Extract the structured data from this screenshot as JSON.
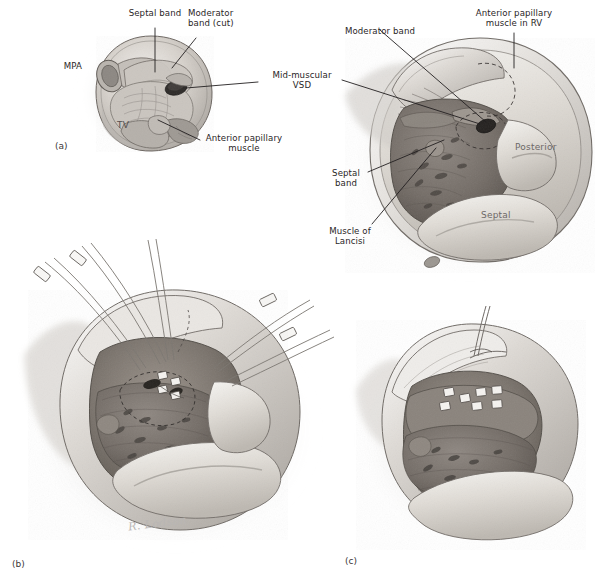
{
  "figure": {
    "style": "grayscale medical illustration",
    "background_color": "#ffffff",
    "ink_color": "#231f20",
    "artist_signature": "R. Lodson"
  },
  "panels": [
    {
      "tag": "(a)",
      "caption": "Right ventricular cavity viewed through right atriotomy with tricuspid valve retracted"
    },
    {
      "tag": "(b)",
      "caption": "Pledgeted mattress sutures placed across the defect with traction sutures on the tricuspid leaflets"
    },
    {
      "tag": "(c)",
      "caption": "Completed patch closure with pledgets seated on the right ventricular septal surface"
    }
  ],
  "labels": {
    "panel_a": [
      {
        "id": "mpa",
        "text": "MPA",
        "align": "right",
        "leader": false
      },
      {
        "id": "tv",
        "text": "TV",
        "align": "left",
        "leader": false
      },
      {
        "id": "septal_band",
        "text": "Septal band",
        "align": "center",
        "leader": true
      },
      {
        "id": "moderator_band_cut",
        "text": "Moderator\nband (cut)",
        "align": "left",
        "leader": true
      },
      {
        "id": "anterior_papillary_muscle",
        "text": "Anterior papillary\nmuscle",
        "align": "center",
        "leader": true
      }
    ],
    "shared": [
      {
        "id": "mid_muscular_vsd",
        "text": "Mid-muscular\nVSD",
        "align": "center",
        "leader": true
      }
    ],
    "panel_top_right": [
      {
        "id": "moderator_band",
        "text": "Moderator band",
        "align": "center",
        "leader": true
      },
      {
        "id": "anterior_papillary_muscle_rv",
        "text": "Anterior papillary\nmuscle in RV",
        "align": "center",
        "leader": true
      },
      {
        "id": "septal_band_2",
        "text": "Septal\nband",
        "align": "center",
        "leader": true
      },
      {
        "id": "muscle_of_lancisi",
        "text": "Muscle of\nLancisi",
        "align": "center",
        "leader": true
      },
      {
        "id": "posterior_leaflet",
        "text": "Posterior",
        "align": "center",
        "leader": false
      },
      {
        "id": "septal_leaflet",
        "text": "Septal",
        "align": "center",
        "leader": false
      }
    ]
  },
  "annotations": {
    "vsd_outline_style": "dashed",
    "pledget_count_panel_b": 4,
    "pledget_count_panel_c": 7,
    "suture_snares_panel_b": 4
  },
  "colors": {
    "muscle_dark": "#6f6862",
    "muscle_mid": "#8f8881",
    "endocardium_light": "#d9d5d0",
    "valve_leaflet": "#cfcac4",
    "shadow": "#b4b0ab",
    "pledget": "#f2f0ec",
    "outline": "#3c3836"
  }
}
